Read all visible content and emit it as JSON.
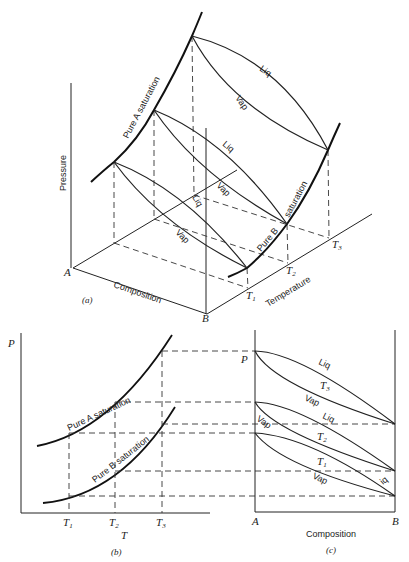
{
  "panel_a": {
    "caption": "(a)",
    "axis_pressure": "Pressure",
    "axis_composition": "Composition",
    "axis_temperature": "Temperature",
    "corner_a": "A",
    "corner_b": "B",
    "t_labels": [
      "T",
      "T",
      "T"
    ],
    "t_subs": [
      "1",
      "2",
      "3"
    ],
    "curve_a_label": "Pure A saturation",
    "curve_b_label_1": "Pure B",
    "curve_b_label_2": "saturation",
    "liq": "Liq",
    "vap": "Vap"
  },
  "panel_b": {
    "caption": "(b)",
    "axis_y": "P",
    "axis_x": "T",
    "t_labels": [
      "T",
      "T",
      "T"
    ],
    "t_subs": [
      "1",
      "2",
      "3"
    ],
    "curve_a_label": "Pure A saturation",
    "curve_b_label": "Pure B saturation"
  },
  "panel_c": {
    "caption": "(c)",
    "axis_y": "P",
    "axis_x": "Composition",
    "corner_a": "A",
    "corner_b": "B",
    "liq": "Liq",
    "vap": "Vap",
    "liq_short": "iq",
    "t3": "T",
    "t3_sub": "3",
    "t2": "T",
    "t2_sub": "2",
    "t1": "T",
    "t1_sub": "1"
  }
}
